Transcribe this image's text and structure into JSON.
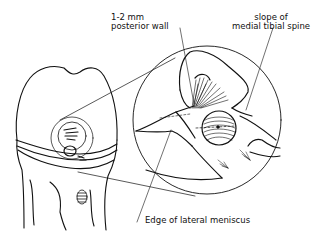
{
  "figure": {
    "labels": {
      "posterior_wall_line1": "1-2 mm",
      "posterior_wall_line2": "posterior wall",
      "tibial_spine_line1": "slope of",
      "tibial_spine_line2": "medial tibial spine",
      "meniscus": "Edge of lateral meniscus"
    },
    "colors": {
      "ink": "#111111",
      "background": "#ffffff"
    }
  }
}
